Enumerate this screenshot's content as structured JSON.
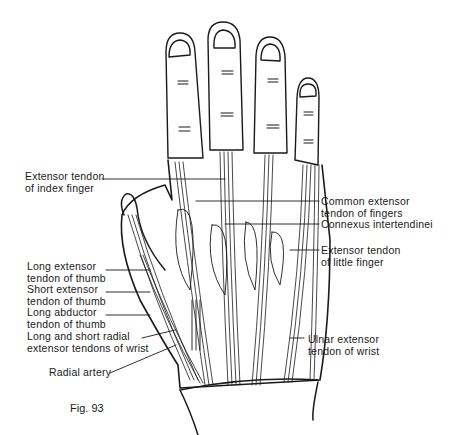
{
  "figure": {
    "caption": "Fig. 93"
  },
  "labels_left": [
    {
      "id": "extensor-tendon-index",
      "line1": "Extensor tendon",
      "line2": "of index finger"
    },
    {
      "id": "long-extensor-thumb",
      "line1": "Long extensor",
      "line2": "tendon of thumb"
    },
    {
      "id": "short-extensor-thumb",
      "line1": "Short extensor",
      "line2": "tendon of thumb"
    },
    {
      "id": "long-abductor-thumb",
      "line1": "Long abductor",
      "line2": "tendon of thumb"
    },
    {
      "id": "radial-extensor-wrist",
      "line1": "Long and short radial",
      "line2": "extensor tendons of wrist"
    },
    {
      "id": "radial-artery",
      "line1": "Radial artery",
      "line2": ""
    }
  ],
  "labels_right": [
    {
      "id": "common-extensor-fingers",
      "line1": "Common extensor",
      "line2": "tendon of fingers"
    },
    {
      "id": "connexus-intertendinei",
      "line1": "Connexus intertendinei",
      "line2": ""
    },
    {
      "id": "extensor-tendon-little",
      "line1": "Extensor tendon",
      "line2": "of little finger"
    },
    {
      "id": "ulnar-extensor-wrist",
      "line1": "Ulnar extensor",
      "line2": "tendon of wrist"
    }
  ],
  "colors": {
    "ink": "#1a1a1a",
    "background": "#ffffff"
  }
}
